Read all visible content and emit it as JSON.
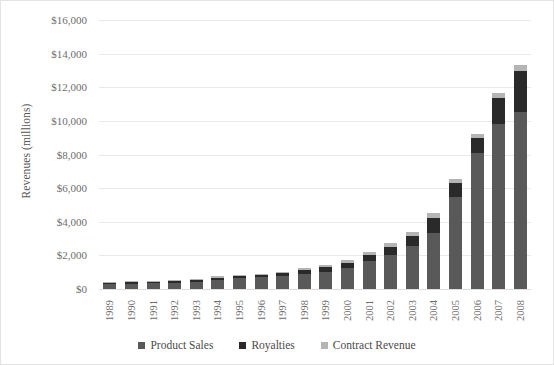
{
  "chart_data": {
    "type": "bar",
    "subtype": "stacked-vertical",
    "title": "",
    "xlabel": "",
    "ylabel": "Revenues (millions)",
    "ylim": [
      0,
      16000
    ],
    "ytick_values": [
      0,
      2000,
      4000,
      6000,
      8000,
      10000,
      12000,
      14000,
      16000
    ],
    "ytick_labels": [
      "$0",
      "$2,000",
      "$4,000",
      "$6,000",
      "$8,000",
      "$10,000",
      "$12,000",
      "$14,000",
      "$16,000"
    ],
    "grid": true,
    "legend_position": "bottom",
    "categories": [
      "1989",
      "1990",
      "1991",
      "1992",
      "1993",
      "1994",
      "1995",
      "1996",
      "1997",
      "1998",
      "1999",
      "2000",
      "2001",
      "2002",
      "2003",
      "2004",
      "2005",
      "2006",
      "2007",
      "2008"
    ],
    "series": [
      {
        "name": "Product Sales",
        "color": "#595959",
        "values": [
          300,
          320,
          340,
          370,
          420,
          560,
          640,
          690,
          760,
          900,
          1000,
          1250,
          1650,
          2050,
          2550,
          3350,
          5500,
          8100,
          9800,
          10500
        ]
      },
      {
        "name": "Royalties",
        "color": "#2a2a2a",
        "values": [
          60,
          60,
          70,
          80,
          100,
          120,
          140,
          150,
          170,
          230,
          280,
          320,
          380,
          450,
          580,
          900,
          800,
          900,
          1550,
          2450
        ]
      },
      {
        "name": "Contract Revenue",
        "color": "#b4b4b4",
        "values": [
          40,
          40,
          40,
          50,
          60,
          70,
          70,
          80,
          90,
          120,
          140,
          180,
          200,
          220,
          250,
          300,
          250,
          250,
          300,
          400
        ]
      }
    ],
    "totals": [
      400,
      420,
      450,
      500,
      580,
      750,
      850,
      920,
      1020,
      1250,
      1420,
      1750,
      2230,
      2720,
      3380,
      4550,
      6550,
      9250,
      11650,
      13350
    ]
  },
  "legend": {
    "items": [
      {
        "label": "Product Sales",
        "color": "#595959"
      },
      {
        "label": "Royalties",
        "color": "#2a2a2a"
      },
      {
        "label": "Contract Revenue",
        "color": "#b4b4b4"
      }
    ]
  }
}
